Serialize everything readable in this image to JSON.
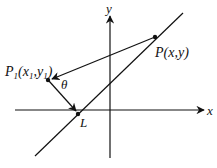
{
  "diagram": {
    "type": "coordinate-geometry",
    "axes": {
      "x_label": "x",
      "y_label": "y"
    },
    "points": {
      "P": {
        "label_main": "P",
        "label_args": "(x,y)"
      },
      "P1": {
        "label_main": "P",
        "label_sub": "1",
        "label_open": "(x",
        "label_x_sub": "1",
        "label_comma": ",y",
        "label_y_sub": "1",
        "label_close": ")"
      },
      "L": {
        "label": "L"
      }
    },
    "angle_label": "θ",
    "colors": {
      "stroke": "#111111",
      "background": "#ffffff"
    }
  }
}
